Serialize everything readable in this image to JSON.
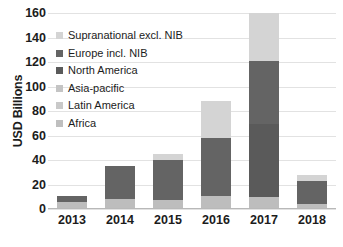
{
  "chart_data": {
    "type": "bar",
    "subtype": "stacked",
    "title": "",
    "xlabel": "",
    "ylabel": "USD Billions",
    "ylim": [
      0,
      160
    ],
    "ytick_values": [
      0,
      20,
      40,
      60,
      80,
      100,
      120,
      140,
      160
    ],
    "ytick_labels": [
      "0",
      "20",
      "40",
      "60",
      "80",
      "100",
      "120",
      "140",
      "160"
    ],
    "grid": true,
    "grid_axis": "y",
    "legend_position": "upper-left-inside",
    "categories": [
      "2013",
      "2014",
      "2015",
      "2016",
      "2017",
      "2018"
    ],
    "series": [
      {
        "name": "Africa",
        "color": "#bfbfbf",
        "values": [
          0,
          0,
          0,
          0,
          0,
          0
        ]
      },
      {
        "name": "Latin America",
        "color": "#c9c9c9",
        "values": [
          0,
          0,
          0,
          0,
          0,
          0
        ]
      },
      {
        "name": "Asia-pacific",
        "color": "#bdbdbd",
        "values": [
          6,
          8,
          7,
          11,
          10,
          4
        ]
      },
      {
        "name": "North America",
        "color": "#5a5a5a",
        "values": [
          0,
          0,
          0,
          0,
          59,
          0
        ]
      },
      {
        "name": "Europe incl. NIB",
        "color": "#646464",
        "values": [
          5,
          27,
          33,
          47,
          52,
          19
        ]
      },
      {
        "name": "Supranational excl. NIB",
        "color": "#d4d4d4",
        "values": [
          0,
          0,
          5,
          30,
          39,
          5
        ]
      }
    ],
    "totals": [
      11,
      35,
      45,
      88,
      160,
      28
    ],
    "legend_entries": [
      {
        "label": "Supranational excl. NIB",
        "color": "#d4d4d4"
      },
      {
        "label": "Europe incl. NIB",
        "color": "#646464"
      },
      {
        "label": "North America",
        "color": "#5a5a5a"
      },
      {
        "label": "Asia-pacific",
        "color": "#c4c4c4"
      },
      {
        "label": "Latin America",
        "color": "#c9c9c9"
      },
      {
        "label": "Africa",
        "color": "#bfbfbf"
      }
    ]
  },
  "axis": {
    "y_title": "USD Billions"
  },
  "colors": {
    "gridline": "#e2e2e2",
    "background": "#ffffff",
    "text": "#1c1c1c"
  }
}
